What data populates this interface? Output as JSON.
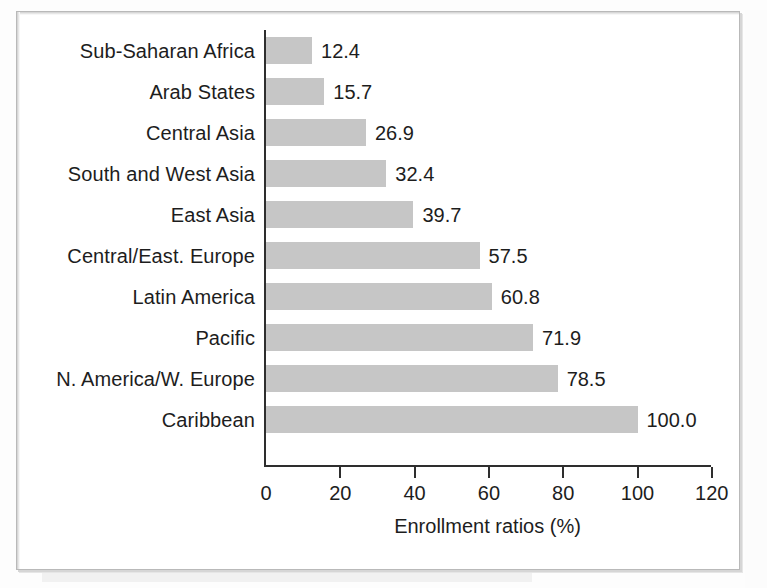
{
  "chart_data": {
    "type": "bar",
    "orientation": "horizontal",
    "title": "",
    "xlabel": "Enrollment ratios (%)",
    "ylabel": "",
    "xlim": [
      0,
      120
    ],
    "xticks": [
      0,
      20,
      40,
      60,
      80,
      100,
      120
    ],
    "xtick_labels": [
      "0",
      "20",
      "40",
      "60",
      "80",
      "100",
      "120"
    ],
    "grid": false,
    "legend": false,
    "bar_color": "#c6c6c6",
    "text_color": "#1d1d1d",
    "axis_color": "#2e2e2e",
    "categories": [
      "Sub-Saharan Africa",
      "Arab States",
      "Central Asia",
      "South and West Asia",
      "East Asia",
      "Central/East. Europe",
      "Latin America",
      "Pacific",
      "N. America/W. Europe",
      "Caribbean"
    ],
    "values": [
      12.4,
      15.7,
      26.9,
      32.4,
      39.7,
      57.5,
      60.8,
      71.9,
      78.5,
      100.0
    ],
    "value_labels": [
      "12.4",
      "15.7",
      "26.9",
      "32.4",
      "39.7",
      "57.5",
      "60.8",
      "71.9",
      "78.5",
      "100.0"
    ]
  },
  "rows": [
    {
      "label": "Sub-Saharan Africa",
      "value": 12.4,
      "value_label": "12.4"
    },
    {
      "label": "Arab States",
      "value": 15.7,
      "value_label": "15.7"
    },
    {
      "label": "Central Asia",
      "value": 26.9,
      "value_label": "26.9"
    },
    {
      "label": "South and West Asia",
      "value": 32.4,
      "value_label": "32.4"
    },
    {
      "label": "East Asia",
      "value": 39.7,
      "value_label": "39.7"
    },
    {
      "label": "Central/East. Europe",
      "value": 57.5,
      "value_label": "57.5"
    },
    {
      "label": "Latin America",
      "value": 60.8,
      "value_label": "60.8"
    },
    {
      "label": "Pacific",
      "value": 71.9,
      "value_label": "71.9"
    },
    {
      "label": "N. America/W. Europe",
      "value": 78.5,
      "value_label": "78.5"
    },
    {
      "label": "Caribbean",
      "value": 100.0,
      "value_label": "100.0"
    }
  ],
  "axis": {
    "ticks": [
      "0",
      "20",
      "40",
      "60",
      "80",
      "100",
      "120"
    ],
    "tick_values": [
      0,
      20,
      40,
      60,
      80,
      100,
      120
    ],
    "title": "Enrollment ratios (%)"
  }
}
